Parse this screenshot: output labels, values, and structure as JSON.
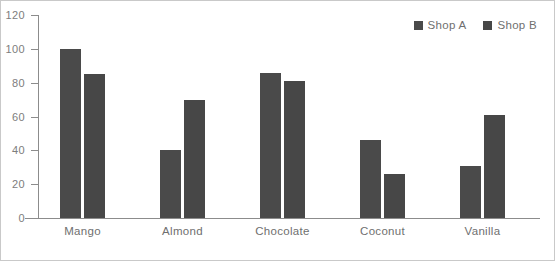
{
  "chart_data": {
    "type": "bar",
    "title": "",
    "subtitle": "",
    "xlabel": "",
    "ylabel": "",
    "categories": [
      "Mango",
      "Almond",
      "Chocolate",
      "Coconut",
      "Vanilla"
    ],
    "series": [
      {
        "name": "Shop A",
        "values": [
          100,
          40,
          86,
          46,
          31
        ],
        "color": "#4a4a4a"
      },
      {
        "name": "Shop B",
        "values": [
          85,
          70,
          81,
          26,
          61
        ],
        "color": "#474747"
      }
    ],
    "ylim": [
      0,
      120
    ],
    "yticks": [
      0,
      20,
      40,
      60,
      80,
      100,
      120
    ],
    "ytick_labels": [
      "0",
      "20",
      "40",
      "60",
      "80",
      "100",
      "120"
    ],
    "grid": false,
    "legend_position": "top-right",
    "annotations": []
  },
  "legend": {
    "items": [
      {
        "label": "Shop A",
        "color": "#4a4a4a"
      },
      {
        "label": "Shop B",
        "color": "#474747"
      }
    ]
  },
  "axis": {
    "y_labels": [
      "120",
      "100",
      "80",
      "60",
      "40",
      "20",
      "0"
    ],
    "x_labels": [
      "Mango",
      "Almond",
      "Chocolate",
      "Coconut",
      "Vanilla"
    ]
  },
  "colors": {
    "bar_a": "#4a4a4a",
    "bar_b": "#474747",
    "axis": "#8c8c8c",
    "text": "#6f6f6f",
    "border": "#c9c9c9",
    "background": "#ffffff"
  }
}
